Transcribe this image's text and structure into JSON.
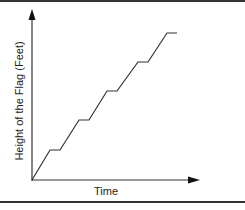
{
  "chart_data": {
    "type": "line",
    "title": "",
    "xlabel": "Time",
    "ylabel": "Height of the Flag (Feet)",
    "x_ticks": [],
    "y_ticks": [],
    "grid": false,
    "legend": null,
    "series": [
      {
        "name": "Flag height",
        "points_pixel": [
          [
            32,
            180
          ],
          [
            50,
            150
          ],
          [
            60,
            150
          ],
          [
            79,
            120
          ],
          [
            89,
            120
          ],
          [
            107,
            91
          ],
          [
            117,
            91
          ],
          [
            138,
            62
          ],
          [
            148,
            62
          ],
          [
            167,
            33
          ],
          [
            177,
            33
          ]
        ],
        "x": [
          0,
          1.8,
          2.8,
          4.7,
          5.7,
          7.5,
          8.5,
          10.6,
          11.6,
          13.5,
          14.5
        ],
        "y": [
          0,
          1,
          1,
          2,
          2,
          3,
          3,
          4,
          4,
          5,
          5
        ]
      }
    ],
    "xlim": [
      0,
      16.7
    ],
    "ylim": [
      0,
      5.7
    ]
  },
  "labels": {
    "x_axis": "Time",
    "y_axis": "Height of the Flag (Feet)"
  }
}
